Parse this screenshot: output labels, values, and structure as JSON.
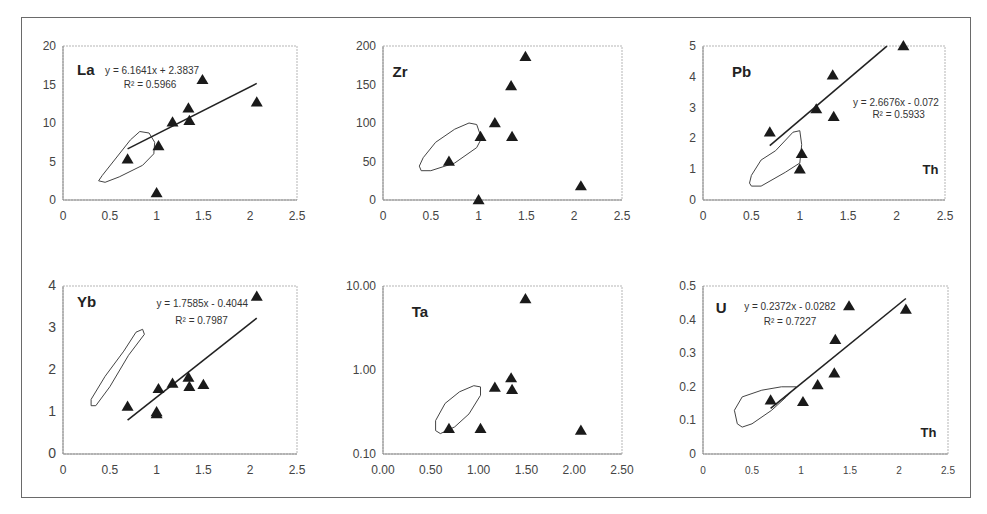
{
  "figure": {
    "x_variable": "Th",
    "caption_visible_text": ""
  },
  "chart_data": [
    {
      "type": "scatter",
      "panel": "La",
      "title": "La",
      "xlabel": "",
      "ylabel": "",
      "xlim": [
        0,
        2.5
      ],
      "ylim": [
        0,
        20
      ],
      "xticks": [
        "0",
        "0.5",
        "1",
        "1.5",
        "2",
        "2.5"
      ],
      "yticks": [
        "0",
        "5",
        "10",
        "15",
        "20"
      ],
      "yscale": "linear",
      "grid": false,
      "x": [
        0.69,
        1.0,
        1.02,
        1.17,
        1.34,
        1.35,
        1.49,
        2.07
      ],
      "y": [
        5.3,
        0.9,
        7.0,
        10.1,
        11.9,
        10.3,
        15.6,
        12.7
      ],
      "trendline": {
        "equation": "y = 6.1641x + 2.3837",
        "r2": "R² = 0.5966",
        "slope": 6.1641,
        "intercept": 2.3837,
        "x_range": [
          0.69,
          2.07
        ]
      },
      "field_outline": [
        [
          0.38,
          2.5
        ],
        [
          0.45,
          2.3
        ],
        [
          0.6,
          3.0
        ],
        [
          0.85,
          4.5
        ],
        [
          0.97,
          6.0
        ],
        [
          0.98,
          7.5
        ],
        [
          0.92,
          8.7
        ],
        [
          0.82,
          8.9
        ],
        [
          0.72,
          7.8
        ],
        [
          0.55,
          5.2
        ],
        [
          0.42,
          3.2
        ],
        [
          0.38,
          2.5
        ]
      ],
      "label_pos": {
        "title": [
          0.15,
          16.2
        ],
        "eq": [
          0.45,
          16.4
        ],
        "r2": [
          0.65,
          14.5
        ]
      }
    },
    {
      "type": "scatter",
      "panel": "Zr",
      "title": "Zr",
      "xlabel": "",
      "ylabel": "",
      "xlim": [
        0,
        2.5
      ],
      "ylim": [
        0,
        200
      ],
      "xticks": [
        "0",
        "0.5",
        "1",
        "1.5",
        "2",
        "2.5"
      ],
      "yticks": [
        "0",
        "50",
        "100",
        "150",
        "200"
      ],
      "yscale": "linear",
      "grid": false,
      "x": [
        0.69,
        1.0,
        1.02,
        1.17,
        1.34,
        1.35,
        1.49,
        2.07
      ],
      "y": [
        50,
        0,
        82,
        100,
        148,
        82,
        186,
        18
      ],
      "trendline": null,
      "field_outline": [
        [
          0.4,
          38
        ],
        [
          0.5,
          38
        ],
        [
          0.75,
          48
        ],
        [
          0.98,
          68
        ],
        [
          1.03,
          80
        ],
        [
          0.98,
          98
        ],
        [
          0.9,
          100
        ],
        [
          0.75,
          92
        ],
        [
          0.55,
          75
        ],
        [
          0.42,
          55
        ],
        [
          0.38,
          44
        ],
        [
          0.4,
          38
        ]
      ],
      "label_pos": {
        "title": [
          0.1,
          160
        ]
      }
    },
    {
      "type": "scatter",
      "panel": "Pb",
      "title": "Pb",
      "xlabel": "Th",
      "ylabel": "",
      "xlim": [
        0,
        2.5
      ],
      "ylim": [
        0,
        5
      ],
      "xticks": [
        "0",
        "0.5",
        "1",
        "1.5",
        "2",
        "2.5"
      ],
      "yticks": [
        "0",
        "1",
        "2",
        "3",
        "4",
        "5"
      ],
      "yscale": "linear",
      "grid": false,
      "x": [
        0.69,
        1.0,
        1.02,
        1.17,
        1.34,
        1.35,
        2.07
      ],
      "y": [
        2.2,
        1.0,
        1.5,
        2.95,
        4.05,
        2.7,
        5.0
      ],
      "trendline": {
        "equation": "y = 2.6676x - 0.072",
        "r2": "R² = 0.5933",
        "slope": 2.6676,
        "intercept": -0.072,
        "x_range": [
          0.69,
          1.9
        ]
      },
      "field_outline": [
        [
          0.5,
          0.45
        ],
        [
          0.6,
          0.45
        ],
        [
          0.85,
          0.9
        ],
        [
          1.0,
          1.2
        ],
        [
          1.02,
          1.8
        ],
        [
          1.0,
          2.25
        ],
        [
          0.93,
          2.2
        ],
        [
          0.75,
          1.6
        ],
        [
          0.6,
          1.3
        ],
        [
          0.5,
          0.8
        ],
        [
          0.48,
          0.55
        ],
        [
          0.5,
          0.45
        ]
      ],
      "label_pos": {
        "title": [
          0.3,
          4.0
        ],
        "eq": [
          1.55,
          3.05
        ],
        "r2": [
          1.75,
          2.65
        ],
        "xlabel": [
          2.35,
          0.85
        ]
      }
    },
    {
      "type": "scatter",
      "panel": "Yb",
      "title": "Yb",
      "xlabel": "",
      "ylabel": "",
      "xlim": [
        0,
        2.5
      ],
      "ylim": [
        0,
        4
      ],
      "xticks": [
        "0",
        "0.5",
        "1",
        "1.5",
        "2",
        "2.5"
      ],
      "yticks": [
        "0",
        "1",
        "2",
        "3",
        "4"
      ],
      "yscale": "linear",
      "grid": false,
      "x": [
        0.69,
        1.0,
        1.0,
        1.02,
        1.17,
        1.34,
        1.35,
        1.5,
        2.07
      ],
      "y": [
        1.13,
        0.95,
        1.0,
        1.55,
        1.68,
        1.82,
        1.6,
        1.65,
        3.75
      ],
      "trendline": {
        "equation": "y = 1.7585x - 0.4044",
        "r2": "R² = 0.7987",
        "slope": 1.7585,
        "intercept": -0.4044,
        "x_range": [
          0.69,
          2.07
        ]
      },
      "field_outline": [
        [
          0.3,
          1.15
        ],
        [
          0.35,
          1.15
        ],
        [
          0.5,
          1.6
        ],
        [
          0.7,
          2.35
        ],
        [
          0.87,
          2.85
        ],
        [
          0.85,
          2.97
        ],
        [
          0.78,
          2.9
        ],
        [
          0.65,
          2.45
        ],
        [
          0.45,
          1.85
        ],
        [
          0.3,
          1.3
        ],
        [
          0.3,
          1.15
        ]
      ],
      "label_pos": {
        "title": [
          0.15,
          3.5
        ],
        "eq": [
          1.0,
          3.5
        ],
        "r2": [
          1.2,
          3.1
        ]
      }
    },
    {
      "type": "scatter",
      "panel": "Ta",
      "title": "Ta",
      "xlabel": "",
      "ylabel": "",
      "xlim": [
        0,
        2.5
      ],
      "ylim": [
        0.1,
        10
      ],
      "xticks": [
        "0.00",
        "0.50",
        "1.00",
        "1.50",
        "2.00",
        "2.50"
      ],
      "yticks": [
        "0.10",
        "1.00",
        "10.00"
      ],
      "yscale": "log",
      "grid": false,
      "x": [
        0.69,
        1.02,
        1.17,
        1.34,
        1.35,
        1.49,
        2.07
      ],
      "y": [
        0.2,
        0.2,
        0.62,
        0.8,
        0.58,
        7.0,
        0.19
      ],
      "trendline": null,
      "field_outline": [
        [
          0.55,
          0.19
        ],
        [
          0.6,
          0.175
        ],
        [
          0.75,
          0.21
        ],
        [
          0.9,
          0.3
        ],
        [
          1.02,
          0.5
        ],
        [
          1.02,
          0.63
        ],
        [
          0.95,
          0.65
        ],
        [
          0.8,
          0.55
        ],
        [
          0.65,
          0.4
        ],
        [
          0.55,
          0.25
        ],
        [
          0.55,
          0.19
        ]
      ],
      "label_pos": {
        "title": [
          0.3,
          4.3
        ]
      }
    },
    {
      "type": "scatter",
      "panel": "U",
      "title": "U",
      "xlabel": "Th",
      "ylabel": "",
      "xlim": [
        0,
        2.5
      ],
      "ylim": [
        0,
        0.5
      ],
      "xticks": [
        "0",
        "0.5",
        "1",
        "1.5",
        "2",
        "2.5"
      ],
      "yticks": [
        "0",
        "0.1",
        "0.2",
        "0.3",
        "0.4",
        "0.5"
      ],
      "yscale": "linear",
      "grid": false,
      "x": [
        0.69,
        1.02,
        1.17,
        1.34,
        1.35,
        1.49,
        2.07
      ],
      "y": [
        0.16,
        0.155,
        0.205,
        0.24,
        0.34,
        0.44,
        0.43
      ],
      "trendline": {
        "equation": "y = 0.2372x - 0.0282",
        "r2": "R² = 0.7227",
        "slope": 0.2372,
        "intercept": -0.0282,
        "x_range": [
          0.69,
          2.07
        ]
      },
      "field_outline": [
        [
          0.4,
          0.08
        ],
        [
          0.5,
          0.09
        ],
        [
          0.7,
          0.13
        ],
        [
          0.85,
          0.17
        ],
        [
          0.95,
          0.2
        ],
        [
          0.8,
          0.2
        ],
        [
          0.6,
          0.19
        ],
        [
          0.4,
          0.17
        ],
        [
          0.32,
          0.13
        ],
        [
          0.35,
          0.09
        ],
        [
          0.4,
          0.08
        ]
      ],
      "label_pos": {
        "title": [
          0.13,
          0.42
        ],
        "eq": [
          0.42,
          0.43
        ],
        "r2": [
          0.62,
          0.385
        ],
        "xlabel": [
          2.3,
          0.05
        ]
      }
    }
  ]
}
